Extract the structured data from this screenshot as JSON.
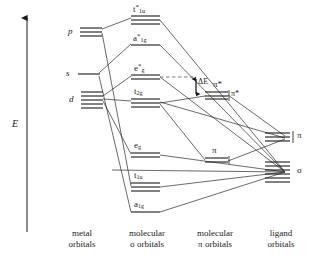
{
  "diagram": {
    "axis": {
      "label": "E",
      "name": "energy-axis"
    },
    "columns": [
      {
        "id": "metal",
        "line1": "metal",
        "line2": "orbitals"
      },
      {
        "id": "mo-sigma",
        "line1": "molecular",
        "line2": "σ orbitals"
      },
      {
        "id": "mo-pi",
        "line1": "molecular",
        "line2": "π orbitals"
      },
      {
        "id": "ligand",
        "line1": "ligand",
        "line2": "orbitals"
      }
    ],
    "annotation": {
      "delta_e": "ΔE",
      "pi_star": "π*"
    },
    "levels": {
      "metal": [
        {
          "id": "p",
          "label": "p",
          "italic": true,
          "sub": "",
          "star": false,
          "lines": 3
        },
        {
          "id": "s",
          "label": "s",
          "italic": true,
          "sub": "",
          "star": false,
          "lines": 1
        },
        {
          "id": "d",
          "label": "d",
          "italic": true,
          "sub": "",
          "star": false,
          "lines": 5
        }
      ],
      "mo_sigma": [
        {
          "id": "t1u-star",
          "label": "t",
          "sub": "1u",
          "star": true,
          "lines": 3
        },
        {
          "id": "a1g-star",
          "label": "a",
          "sub": "1g",
          "star": true,
          "lines": 1
        },
        {
          "id": "eg-star",
          "label": "e",
          "sub": "g",
          "star": true,
          "lines": 2
        },
        {
          "id": "t2g",
          "label": "t",
          "sub": "2g",
          "star": false,
          "lines": 3
        },
        {
          "id": "eg",
          "label": "e",
          "sub": "g",
          "star": false,
          "lines": 2
        },
        {
          "id": "t1u",
          "label": "t",
          "sub": "1u",
          "star": false,
          "lines": 3
        },
        {
          "id": "a1g",
          "label": "a",
          "sub": "1g",
          "star": false,
          "lines": 1
        }
      ],
      "mo_pi": [
        {
          "id": "pi-star-mo",
          "label": "π*",
          "sub": "",
          "star": false,
          "lines": 3
        },
        {
          "id": "pi-mo",
          "label": "π",
          "sub": "",
          "star": false,
          "lines": 2
        }
      ],
      "ligand": [
        {
          "id": "lig-pi",
          "label": "π",
          "sub": "",
          "star": false,
          "lines": 3
        },
        {
          "id": "lig-sigma",
          "label": "σ",
          "sub": "",
          "star": false,
          "lines": 6
        }
      ]
    }
  }
}
